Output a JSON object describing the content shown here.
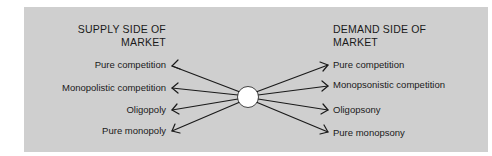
{
  "diagram": {
    "supply_side": {
      "heading_line1": "SUPPLY SIDE OF",
      "heading_line2": "MARKET",
      "items": [
        {
          "label": "Pure competition"
        },
        {
          "label": "Monopolistic competition"
        },
        {
          "label": "Oligopoly"
        },
        {
          "label": "Pure monopoly"
        }
      ]
    },
    "demand_side": {
      "heading_line1": "DEMAND SIDE OF",
      "heading_line2": "MARKET",
      "items": [
        {
          "label": "Pure competition"
        },
        {
          "label": "Monopsonistic competition"
        },
        {
          "label": "Oligopsony"
        },
        {
          "label": "Pure monopsony"
        }
      ]
    },
    "colors": {
      "panel_background": "#cfcfcf",
      "text": "#1a1a1a",
      "arrow": "#1a1a1a",
      "center_node": "#ffffff"
    }
  }
}
